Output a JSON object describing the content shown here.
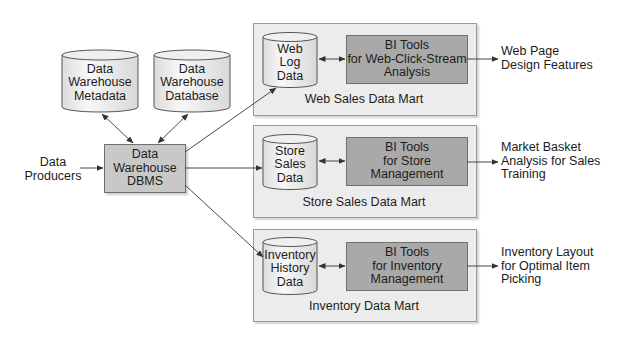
{
  "diagram": {
    "sources": {
      "metadata_cylinder": {
        "label": "Data\nWarehouse\nMetadata"
      },
      "database_cylinder": {
        "label": "Data\nWarehouse\nDatabase"
      },
      "producers": {
        "label": "Data\nProducers"
      },
      "dbms": {
        "label": "Data\nWarehouse\nDBMS"
      }
    },
    "marts": [
      {
        "title": "Web Sales Data Mart",
        "data_store": "Web\nLog\nData",
        "bi_tool": "BI Tools\nfor Web-Click-Stream\nAnalysis",
        "output": "Web Page\nDesign Features"
      },
      {
        "title": "Store Sales Data Mart",
        "data_store": "Store\nSales\nData",
        "bi_tool": "BI Tools\nfor Store\nManagement",
        "output": "Market Basket\nAnalysis for Sales\nTraining"
      },
      {
        "title": "Inventory Data Mart",
        "data_store": "Inventory\nHistory\nData",
        "bi_tool": "BI Tools\nfor Inventory\nManagement",
        "output": "Inventory Layout\nfor Optimal Item\nPicking"
      }
    ],
    "colors": {
      "mart_fill": "#ececec",
      "bi_fill": "#a9a9a9",
      "dbms_fill": "#c8c8c8",
      "cylinder_fill": "#f2f2f2",
      "line": "#333333"
    }
  }
}
